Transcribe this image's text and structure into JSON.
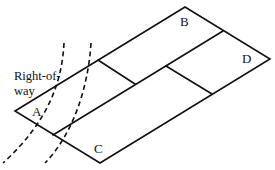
{
  "diagram": {
    "labels": {
      "A": "A",
      "B": "B",
      "C": "C",
      "D": "D",
      "row_line1": "Right-of-",
      "row_line2": "way"
    }
  }
}
